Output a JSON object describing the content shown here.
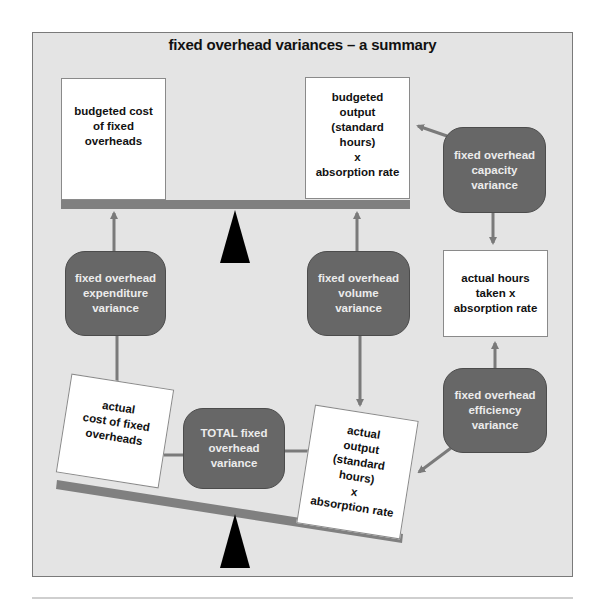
{
  "title": "fixed overhead variances – a summary",
  "colors": {
    "panel_bg": "#e4e4e4",
    "beam": "#808080",
    "pill": "#676767",
    "pill_text": "#ececec",
    "arrow": "#7a7a7a",
    "fulcrum": "#000000"
  },
  "boxes": {
    "budgeted_cost": "budgeted cost\nof fixed\noverheads",
    "budgeted_output": "budgeted\noutput\n(standard\nhours)\nx\nabsorption rate",
    "actual_hours": "actual hours\ntaken x\nabsorption rate",
    "actual_cost": "actual\ncost of fixed\noverheads",
    "actual_output": "actual\noutput\n(standard\nhours)\nx\nabsorption rate"
  },
  "variances": {
    "expenditure": "fixed overhead\nexpenditure\nvariance",
    "volume": "fixed overhead\nvolume\nvariance",
    "capacity": "fixed overhead\ncapacity\nvariance",
    "efficiency": "fixed overhead\nefficiency\nvariance",
    "total": "TOTAL fixed\noverhead\nvariance"
  }
}
